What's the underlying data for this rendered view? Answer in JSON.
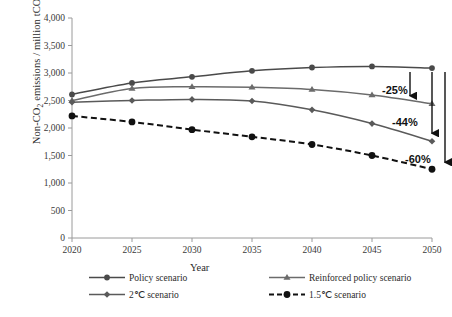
{
  "chart_data": {
    "type": "line",
    "title": "",
    "xlabel": "Year",
    "ylabel": "Non-CO2 emissions / million tCO2e",
    "x": [
      2020,
      2025,
      2030,
      2035,
      2040,
      2045,
      2050
    ],
    "xlim": [
      2020,
      2050
    ],
    "ylim": [
      0,
      4000
    ],
    "ytick_labels": [
      "0",
      "500",
      "1,000",
      "1,500",
      "2,000",
      "2,500",
      "3,000",
      "3,500",
      "4,000"
    ],
    "ytick_values": [
      0,
      500,
      1000,
      1500,
      2000,
      2500,
      3000,
      3500,
      4000
    ],
    "xtick_labels": [
      "2020",
      "2025",
      "2030",
      "2035",
      "2040",
      "2045",
      "2050"
    ],
    "grid": false,
    "legend_position": "bottom",
    "series": [
      {
        "name": "Policy scenario",
        "marker": "circle",
        "line": "solid",
        "color": "#4a4a4a",
        "values": [
          2610,
          2820,
          2930,
          3040,
          3100,
          3120,
          3090
        ]
      },
      {
        "name": "Reinforced policy scenario",
        "marker": "triangle",
        "line": "solid",
        "color": "#6b6b6b",
        "values": [
          2500,
          2720,
          2750,
          2740,
          2700,
          2600,
          2440
        ]
      },
      {
        "name": "2℃ scenario",
        "marker": "diamond",
        "line": "solid",
        "color": "#5a5a5a",
        "values": [
          2470,
          2500,
          2520,
          2490,
          2330,
          2080,
          1760
        ]
      },
      {
        "name": "1.5℃ scenario",
        "marker": "circle",
        "line": "dashed",
        "color": "#111111",
        "values": [
          2220,
          2110,
          1970,
          1840,
          1700,
          1500,
          1250
        ]
      }
    ],
    "annotations": [
      {
        "label": "-25%",
        "series": "Policy scenario"
      },
      {
        "label": "-44%",
        "series": "Reinforced policy scenario"
      },
      {
        "label": "-60%",
        "series": "2℃ scenario"
      }
    ]
  },
  "axis": {
    "x_title": "Year",
    "y_title_prefix": "Non-CO",
    "y_title_sub1": "2",
    "y_title_mid": " emissions / million tCO",
    "y_title_sub2": "2",
    "y_title_suffix": "e"
  }
}
